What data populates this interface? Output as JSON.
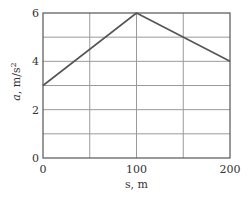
{
  "chart_data": {
    "type": "line",
    "title": "",
    "xlabel": "s, m",
    "ylabel_italic": "a",
    "ylabel_units": ", m/s",
    "ylabel_exp": "2",
    "xlim": [
      0,
      200
    ],
    "ylim": [
      0,
      6
    ],
    "grid": true,
    "x_grid_step": 50,
    "y_grid_step": 1,
    "x_ticks": [
      0,
      100,
      200
    ],
    "y_ticks": [
      0,
      2,
      4,
      6
    ],
    "x_tick_labels": [
      "0",
      "100",
      "200"
    ],
    "y_tick_labels": [
      "0",
      "2",
      "4",
      "6"
    ],
    "series": [
      {
        "name": "a(s)",
        "x": [
          0,
          100,
          200
        ],
        "y": [
          3,
          6,
          4
        ]
      }
    ],
    "colors": {
      "line": "#555555",
      "grid": "#9a9a9a",
      "frame": "#555555"
    }
  }
}
